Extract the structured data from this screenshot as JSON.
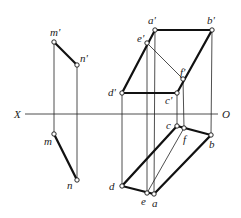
{
  "diagram": {
    "type": "orthographic-projection",
    "axis": {
      "left_label": "X",
      "right_label": "O",
      "y": 114,
      "x1": 25,
      "x2": 218
    },
    "line_mn": {
      "front": {
        "m_prime": {
          "label": "m'",
          "x": 54,
          "y": 42
        },
        "n_prime": {
          "label": "n'",
          "x": 77,
          "y": 65
        }
      },
      "top": {
        "m": {
          "label": "m",
          "x": 54,
          "y": 134
        },
        "n": {
          "label": "n",
          "x": 77,
          "y": 180
        }
      }
    },
    "plane": {
      "front": {
        "a_prime": {
          "label": "a'",
          "x": 155,
          "y": 30
        },
        "b_prime": {
          "label": "b'",
          "x": 212,
          "y": 30
        },
        "c_prime": {
          "label": "c'",
          "x": 177,
          "y": 93
        },
        "d_prime": {
          "label": "d'",
          "x": 122,
          "y": 93
        },
        "e_prime": {
          "label": "e'",
          "x": 147,
          "y": 43
        },
        "f_prime": {
          "label": "f'",
          "x": 183,
          "y": 79
        }
      },
      "top": {
        "a": {
          "label": "a",
          "x": 154,
          "y": 194
        },
        "b": {
          "label": "b",
          "x": 211,
          "y": 135
        },
        "c": {
          "label": "c",
          "x": 177,
          "y": 126
        },
        "d": {
          "label": "d",
          "x": 122,
          "y": 186
        },
        "e": {
          "label": "e",
          "x": 147,
          "y": 193
        },
        "f": {
          "label": "f",
          "x": 184,
          "y": 128
        }
      }
    }
  }
}
